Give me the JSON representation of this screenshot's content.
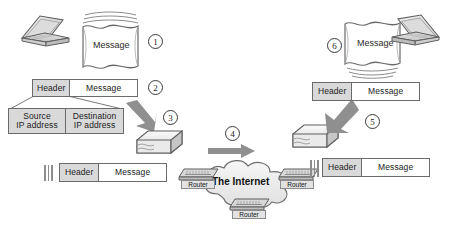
{
  "diagram": {
    "colors": {
      "outline": "#6b6b6b",
      "shaded_fill": "#d9d9d9",
      "plain_fill": "#ffffff",
      "arrow_fill": "#9a9a9a",
      "cloud_fill": "#ededed",
      "device_fill": "#e3e3e3",
      "text": "#1b1b1b"
    },
    "steps": [
      {
        "number": "1",
        "label": "Message composed on sending computer"
      },
      {
        "number": "2",
        "label": "Header added to message"
      },
      {
        "number": "3",
        "label": "Message packaged into packet"
      },
      {
        "number": "4",
        "label": "Packet travels across the Internet"
      },
      {
        "number": "5",
        "label": "Packet unpacked at destination"
      },
      {
        "number": "6",
        "label": "Message delivered to receiving computer"
      }
    ],
    "source_side": {
      "laptop_name": "sender-laptop",
      "message_label": "Message",
      "packet_row": {
        "header": "Header",
        "message": "Message"
      },
      "header_detail": {
        "source_line1": "Source",
        "source_line2": "IP address",
        "destination_line1": "Destination",
        "destination_line2": "IP address"
      },
      "transmitted_row": {
        "header": "Header",
        "message": "Message"
      }
    },
    "network": {
      "cloud_label": "The Internet",
      "routers": [
        {
          "label": "Router",
          "position": "left"
        },
        {
          "label": "Router",
          "position": "right"
        },
        {
          "label": "Router",
          "position": "bottom"
        }
      ]
    },
    "destination_side": {
      "laptop_name": "receiver-laptop",
      "message_label": "Message",
      "packet_row": {
        "header": "Header",
        "message": "Message"
      },
      "received_row": {
        "header": "Header",
        "message": "Message"
      }
    }
  }
}
